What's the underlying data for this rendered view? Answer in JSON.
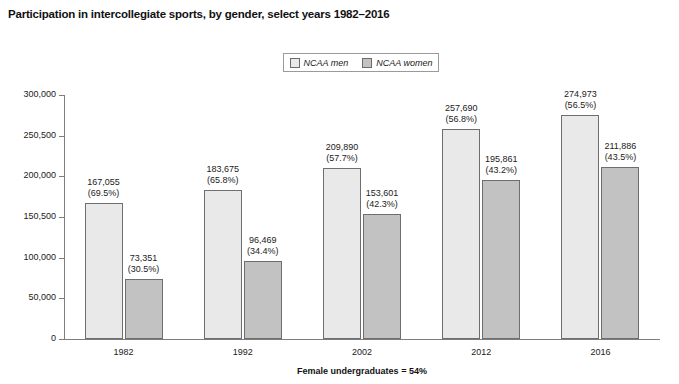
{
  "title": "Participation in intercollegiate sports, by gender, select years 1982–2016",
  "legend": {
    "men_label": "NCAA men",
    "women_label": "NCAA women",
    "men_color": "#e9e9e9",
    "women_color": "#c2c2c2"
  },
  "footnote": "Female undergraduates = 54%",
  "axis": {
    "y_ticks": [
      "0",
      "50,000",
      "100,000",
      "150,500",
      "200,000",
      "250,500",
      "300,000"
    ]
  },
  "labels": {
    "men": [
      {
        "value": "167,055",
        "pct": "(69.5%)"
      },
      {
        "value": "183,675",
        "pct": "(65.8%)"
      },
      {
        "value": "209,890",
        "pct": "(57.7%)"
      },
      {
        "value": "257,690",
        "pct": "(56.8%)"
      },
      {
        "value": "274,973",
        "pct": "(56.5%)"
      }
    ],
    "women": [
      {
        "value": "73,351",
        "pct": "(30.5%)"
      },
      {
        "value": "96,469",
        "pct": "(34.4%)"
      },
      {
        "value": "153,601",
        "pct": "(42.3%)"
      },
      {
        "value": "195,861",
        "pct": "(43.2%)"
      },
      {
        "value": "211,886",
        "pct": "(43.5%)"
      }
    ]
  },
  "chart_data": {
    "type": "bar",
    "title": "Participation in intercollegiate sports, by gender, select years 1982–2016",
    "xlabel": "",
    "ylabel": "",
    "categories": [
      "1982",
      "1992",
      "2002",
      "2012",
      "2016"
    ],
    "series": [
      {
        "name": "NCAA men",
        "values": [
          167055,
          183675,
          209890,
          257690,
          274973
        ],
        "percents": [
          69.5,
          65.8,
          57.7,
          56.8,
          56.5
        ],
        "color": "#e9e9e9"
      },
      {
        "name": "NCAA women",
        "values": [
          73351,
          96469,
          153601,
          195861,
          211886
        ],
        "percents": [
          30.5,
          34.4,
          42.3,
          43.2,
          43.5
        ],
        "color": "#c2c2c2"
      }
    ],
    "ylim": [
      0,
      300000
    ],
    "ytick_labels": [
      "0",
      "50,000",
      "100,000",
      "150,500",
      "200,000",
      "250,500",
      "300,000"
    ],
    "ytick_positions": [
      0,
      50000,
      100000,
      150000,
      200000,
      250000,
      300000
    ],
    "grid": false,
    "legend_position": "top-center",
    "annotation": "Female undergraduates = 54%"
  }
}
